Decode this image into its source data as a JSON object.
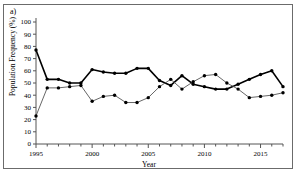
{
  "figure": {
    "panel_label": "a)",
    "background": "#ffffff",
    "frame_color": "#6b6b6b"
  },
  "chart_data": {
    "type": "line",
    "title": "",
    "xlabel": "Year",
    "ylabel": "Population Frequency (%)",
    "xlim": [
      1995,
      2017
    ],
    "ylim": [
      0,
      100
    ],
    "xticks": [
      1995,
      1996,
      1997,
      1998,
      1999,
      2000,
      2001,
      2002,
      2003,
      2004,
      2005,
      2006,
      2007,
      2008,
      2009,
      2010,
      2011,
      2012,
      2013,
      2014,
      2015,
      2016,
      2017
    ],
    "xtick_labels": [
      "1995",
      "",
      "",
      "",
      "",
      "2000",
      "",
      "",
      "",
      "",
      "2005",
      "",
      "",
      "",
      "",
      "2010",
      "",
      "",
      "",
      "",
      "2015",
      "",
      ""
    ],
    "yticks": [
      0,
      10,
      20,
      30,
      40,
      50,
      60,
      70,
      80,
      90,
      100
    ],
    "ytick_labels": [
      "0",
      "10",
      "20",
      "30",
      "40",
      "50",
      "60",
      "70",
      "80",
      "90",
      "100"
    ],
    "grid": false,
    "legend": "none",
    "marker": "filled-circle",
    "x": [
      1995,
      1996,
      1997,
      1998,
      1999,
      2000,
      2001,
      2002,
      2003,
      2004,
      2005,
      2006,
      2007,
      2008,
      2009,
      2010,
      2011,
      2012,
      2013,
      2014,
      2015,
      2016,
      2017
    ],
    "series": [
      {
        "name": "series-upper",
        "color": "#000000",
        "line_width": 1.6,
        "values": [
          77,
          53,
          53,
          50,
          50,
          61,
          59,
          58,
          58,
          62,
          62,
          52,
          48,
          56,
          49,
          47,
          45,
          45,
          49,
          53,
          57,
          60,
          47
        ]
      },
      {
        "name": "series-lower",
        "color": "#555555",
        "line_width": 0.9,
        "values": [
          23,
          46,
          46,
          47,
          48,
          35,
          39,
          40,
          34,
          34,
          38,
          47,
          53,
          45,
          51,
          56,
          57,
          50,
          45,
          38,
          39,
          40,
          42
        ]
      }
    ],
    "annotations": []
  }
}
